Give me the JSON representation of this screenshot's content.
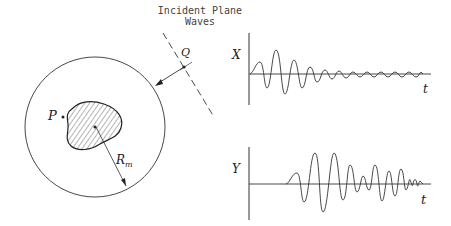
{
  "diagram": {
    "incident_label_line1": "Incident Plane",
    "incident_label_line2": "Waves",
    "point_q": "Q",
    "point_p": "P",
    "radius_label": "R",
    "radius_subscript": "m",
    "plot_x": {
      "axis_label": "X",
      "time_label": "t"
    },
    "plot_y": {
      "axis_label": "Y",
      "time_label": "t"
    }
  }
}
